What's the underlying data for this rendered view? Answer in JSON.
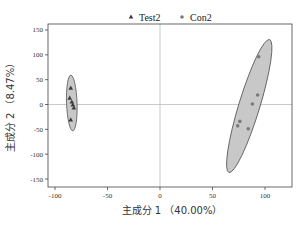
{
  "chart_data": {
    "type": "scatter",
    "title": "",
    "xlabel": "主成分 1 （40.00%）",
    "ylabel": "主成分 2 （8.47%）",
    "xlim": [
      -103,
      122
    ],
    "ylim": [
      -165,
      162
    ],
    "xticks": [
      -100,
      -50,
      0,
      50,
      100
    ],
    "yticks": [
      150,
      100,
      50,
      0,
      -50,
      -100,
      -150
    ],
    "grid": false,
    "zero_lines": true,
    "legend_position": "top-center",
    "series": [
      {
        "name": "Test2",
        "marker": "triangle",
        "color": "#3a3a3a",
        "points": [
          {
            "x": -85,
            "y": 33
          },
          {
            "x": -86,
            "y": 13
          },
          {
            "x": -84,
            "y": 5
          },
          {
            "x": -83,
            "y": -1
          },
          {
            "x": -82,
            "y": -7
          },
          {
            "x": -85,
            "y": -31
          }
        ],
        "ellipse": {
          "cx": -84,
          "cy": 3,
          "rx": 5,
          "ry": 56,
          "angle_deg": -2
        }
      },
      {
        "name": "Con2",
        "marker": "circle",
        "color": "#7a7a7a",
        "points": [
          {
            "x": 94,
            "y": 96
          },
          {
            "x": 93,
            "y": 19
          },
          {
            "x": 88,
            "y": 1
          },
          {
            "x": 76,
            "y": -34
          },
          {
            "x": 74,
            "y": -43
          },
          {
            "x": 84,
            "y": -49
          }
        ],
        "ellipse": {
          "cx": 85,
          "cy": -3,
          "rx": 10,
          "ry": 140,
          "angle_deg": 17
        }
      }
    ]
  },
  "legend": {
    "items": [
      {
        "label": "Test2",
        "marker": "triangle"
      },
      {
        "label": "Con2",
        "marker": "circle"
      }
    ]
  },
  "colors": {
    "ellipse_fill": "#c8c8c8",
    "ellipse_stroke": "#555555",
    "axis": "#444444",
    "zero_line": "#bbbbbb"
  }
}
